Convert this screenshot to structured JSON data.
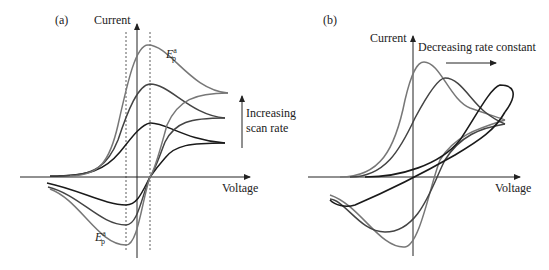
{
  "panel_a": {
    "label": "(a)",
    "y_axis_label": "Current",
    "x_axis_label": "Voltage",
    "annotation_line1": "Increasing",
    "annotation_line2": "scan rate",
    "anodic_peak_label": "E",
    "anodic_peak_sup": "a",
    "anodic_peak_sub": "p",
    "cathodic_peak_label": "E",
    "cathodic_peak_sup": "a",
    "cathodic_peak_sub": "p"
  },
  "panel_b": {
    "label": "(b)",
    "y_axis_label": "Current",
    "x_axis_label": "Voltage",
    "annotation": "Decreasing rate constant"
  },
  "colors": {
    "dark_curve": "#1a1a1a",
    "medium_curve": "#444444",
    "light_curve": "#777777",
    "axis": "#222222"
  }
}
